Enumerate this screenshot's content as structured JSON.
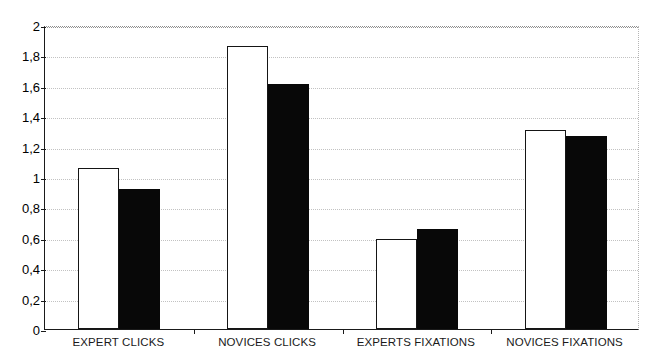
{
  "chart_data": {
    "type": "bar",
    "title": "",
    "xlabel": "",
    "ylabel": "",
    "ylim": [
      0,
      2
    ],
    "grid": true,
    "legend_position": "none",
    "categories": [
      "EXPERT CLICKS",
      "NOVICES CLICKS",
      "EXPERTS FIXATIONS",
      "NOVICES FIXATIONS"
    ],
    "ytick_labels": [
      "2",
      "1,8",
      "1,6",
      "1,4",
      "1,2",
      "1",
      "0,8",
      "0,6",
      "0,4",
      "0,2",
      "0"
    ],
    "ytick_values": [
      2,
      1.8,
      1.6,
      1.4,
      1.2,
      1,
      0.8,
      0.6,
      0.4,
      0.2,
      0
    ],
    "series": [
      {
        "name": "series-1",
        "style": "white-filled-black-outline",
        "color": "#ffffff",
        "edge_color": "#151515",
        "values": [
          1.06,
          1.86,
          0.59,
          1.31
        ]
      },
      {
        "name": "series-2",
        "style": "black-filled",
        "color": "#080808",
        "edge_color": "#080808",
        "values": [
          0.92,
          1.61,
          0.66,
          1.27
        ]
      }
    ]
  }
}
